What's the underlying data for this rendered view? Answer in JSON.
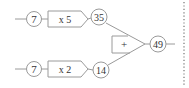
{
  "diagram": {
    "row1": {
      "input": "7",
      "operation": "x 5",
      "output": "35"
    },
    "row2": {
      "input": "7",
      "operation": "x 2",
      "output": "14"
    },
    "adder": {
      "operation": "+",
      "result": "49"
    }
  },
  "colors": {
    "stroke": "#9a9a9a",
    "text": "#333333",
    "dots": "#888888"
  }
}
